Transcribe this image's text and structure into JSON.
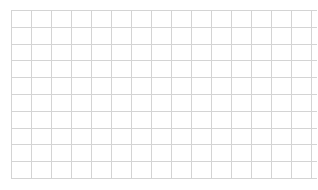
{
  "page": {
    "background_color": "#ffffff",
    "width": 317,
    "height": 190
  },
  "grid": {
    "name": "empty-grid",
    "description": "Blank ruled grid / graph-paper table with no content",
    "line_color": "#d4d4d4",
    "cell_fill_color": "#ffffff",
    "origin_x": 11,
    "origin_y": 10,
    "grid_width": 295,
    "grid_height": 168,
    "column_count": 16,
    "row_count": 10,
    "column_width": 19,
    "narrow_last_column_width": 10,
    "row_height": 16.8,
    "cells": [
      [
        "",
        "",
        "",
        "",
        "",
        "",
        "",
        "",
        "",
        "",
        "",
        "",
        "",
        "",
        "",
        ""
      ],
      [
        "",
        "",
        "",
        "",
        "",
        "",
        "",
        "",
        "",
        "",
        "",
        "",
        "",
        "",
        "",
        ""
      ],
      [
        "",
        "",
        "",
        "",
        "",
        "",
        "",
        "",
        "",
        "",
        "",
        "",
        "",
        "",
        "",
        ""
      ],
      [
        "",
        "",
        "",
        "",
        "",
        "",
        "",
        "",
        "",
        "",
        "",
        "",
        "",
        "",
        "",
        ""
      ],
      [
        "",
        "",
        "",
        "",
        "",
        "",
        "",
        "",
        "",
        "",
        "",
        "",
        "",
        "",
        "",
        ""
      ],
      [
        "",
        "",
        "",
        "",
        "",
        "",
        "",
        "",
        "",
        "",
        "",
        "",
        "",
        "",
        "",
        ""
      ],
      [
        "",
        "",
        "",
        "",
        "",
        "",
        "",
        "",
        "",
        "",
        "",
        "",
        "",
        "",
        "",
        ""
      ],
      [
        "",
        "",
        "",
        "",
        "",
        "",
        "",
        "",
        "",
        "",
        "",
        "",
        "",
        "",
        "",
        ""
      ],
      [
        "",
        "",
        "",
        "",
        "",
        "",
        "",
        "",
        "",
        "",
        "",
        "",
        "",
        "",
        "",
        ""
      ],
      [
        "",
        "",
        "",
        "",
        "",
        "",
        "",
        "",
        "",
        "",
        "",
        "",
        "",
        "",
        "",
        ""
      ]
    ]
  }
}
